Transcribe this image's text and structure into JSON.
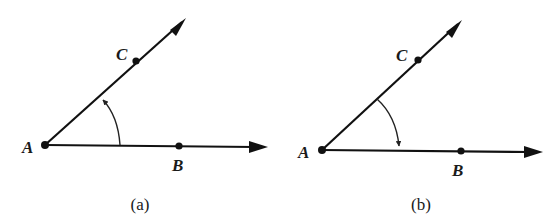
{
  "figure": {
    "panels": [
      {
        "caption": "(a)",
        "points": {
          "A": "A",
          "B": "B",
          "C": "C"
        },
        "angle_direction": "counterclockwise from AB to AC"
      },
      {
        "caption": "(b)",
        "points": {
          "A": "A",
          "B": "B",
          "C": "C"
        },
        "angle_direction": "clockwise from AC to AB"
      }
    ]
  }
}
